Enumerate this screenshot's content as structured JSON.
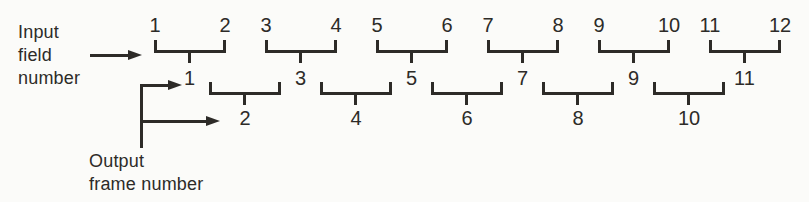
{
  "labels": {
    "input_lines": [
      "Input",
      "field",
      "number"
    ],
    "output_lines": [
      "Output",
      "frame number"
    ]
  },
  "diagram": {
    "input_field_numbers": [
      "1",
      "2",
      "3",
      "4",
      "5",
      "6",
      "7",
      "8",
      "9",
      "10",
      "11",
      "12"
    ],
    "upper_output_frame_numbers": [
      "1",
      "3",
      "5",
      "7",
      "9",
      "11"
    ],
    "lower_output_frame_numbers": [
      "2",
      "4",
      "6",
      "8",
      "10"
    ]
  },
  "colors": {
    "ink": "#2d2b28",
    "background": "#fbfbf9"
  }
}
